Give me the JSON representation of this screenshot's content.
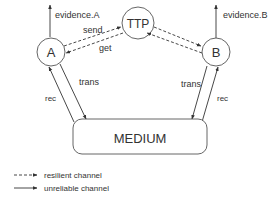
{
  "diagram": {
    "nodes": {
      "a": {
        "label": "A"
      },
      "ttp": {
        "label": "TTP"
      },
      "b": {
        "label": "B"
      },
      "medium": {
        "label": "MEDIUM"
      }
    },
    "edges": {
      "evidence_a": {
        "label": "evidence.A"
      },
      "evidence_b": {
        "label": "evidence.B"
      },
      "send": {
        "label": "send"
      },
      "get": {
        "label": "get"
      },
      "a_trans": {
        "label": "trans"
      },
      "a_rec": {
        "label": "rec"
      },
      "b_trans": {
        "label": "trans"
      },
      "b_rec": {
        "label": "rec"
      }
    },
    "legend": {
      "resilient": {
        "label": "resilient channel",
        "style": "dashed"
      },
      "unreliable": {
        "label": "unreliable channel",
        "style": "solid"
      }
    },
    "colors": {
      "stroke": "#333333",
      "text": "#333333",
      "background": "#ffffff"
    }
  }
}
